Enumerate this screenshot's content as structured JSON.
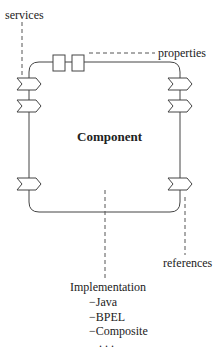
{
  "diagram": {
    "component_label": "Component",
    "labels": {
      "services": "services",
      "properties": "properties",
      "references": "references",
      "implementation": "Implementation"
    },
    "implementation_items": [
      "−Java",
      "−BPEL",
      "−Composite",
      ". . ."
    ],
    "service_count": 3,
    "reference_count": 3,
    "property_count": 2,
    "colors": {
      "stroke": "#444444",
      "text": "#222222",
      "background": "#ffffff"
    }
  }
}
